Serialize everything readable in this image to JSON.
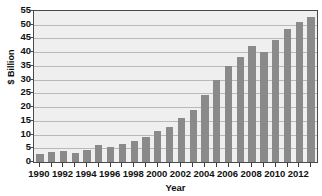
{
  "chart_data": {
    "type": "bar",
    "title": "",
    "xlabel": "Year",
    "ylabel": "$ Billion",
    "ylim": [
      0,
      55
    ],
    "ytick_step": 5,
    "grid": true,
    "legend": "none",
    "bar_color": "#8a8a8a",
    "plot_background": "#efefef",
    "gridline_color": "#b9b9b9",
    "axis_color": "#4a4a4a",
    "categories": [
      "1990",
      "1991",
      "1992",
      "1993",
      "1994",
      "1995",
      "1996",
      "1997",
      "1998",
      "1999",
      "2000",
      "2001",
      "2002",
      "2003",
      "2004",
      "2005",
      "2006",
      "2007",
      "2008",
      "2009",
      "2010",
      "2011",
      "2012",
      "2013"
    ],
    "values": [
      3.0,
      3.6,
      3.9,
      3.3,
      4.4,
      6.1,
      5.4,
      6.5,
      7.7,
      9.2,
      11.4,
      12.8,
      16.2,
      18.8,
      24.5,
      29.9,
      34.8,
      38.4,
      42.4,
      39.9,
      44.6,
      48.4,
      50.9,
      53.0
    ],
    "ytick_labels": [
      "0",
      "5",
      "10",
      "15",
      "20",
      "25",
      "30",
      "35",
      "40",
      "45",
      "50",
      "55"
    ],
    "xtick_labels": [
      "1990",
      "1992",
      "1994",
      "1996",
      "1998",
      "2000",
      "2002",
      "2004",
      "2006",
      "2008",
      "2010",
      "2012"
    ]
  }
}
